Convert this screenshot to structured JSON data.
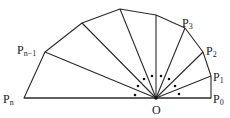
{
  "diagram": {
    "center_label": "O",
    "vertex_labels": [
      {
        "id": "P0",
        "main": "P",
        "sub": "0"
      },
      {
        "id": "P1",
        "main": "P",
        "sub": "1"
      },
      {
        "id": "P2",
        "main": "P",
        "sub": "2"
      },
      {
        "id": "P3",
        "main": "P",
        "sub": "3"
      },
      {
        "id": "Pn-1",
        "main": "P",
        "sub": "n−1"
      },
      {
        "id": "Pn",
        "main": "P",
        "sub": "n"
      }
    ],
    "angle_marker_count": 8
  }
}
